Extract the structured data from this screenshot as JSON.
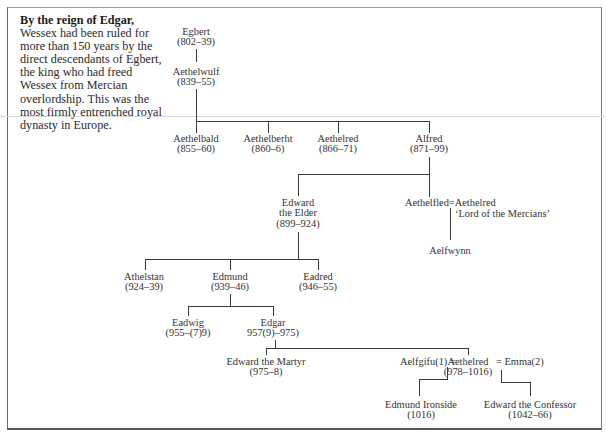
{
  "intro": {
    "lead": "By the reign of Edgar,",
    "body": "Wessex had been ruled for more than 150 years by the direct descendants of Egbert, the king who had freed Wessex from Mercian overlordship. This was the most firmly entrenched royal dynasty in Europe."
  },
  "tree": {
    "egbert": {
      "name": "Egbert",
      "dates": "(802–39)"
    },
    "aethelwulf": {
      "name": "Aethelwulf",
      "dates": "(839–55)"
    },
    "aethelbald": {
      "name": "Aethelbald",
      "dates": "(855–60)"
    },
    "aethelberht": {
      "name": "Aethelberht",
      "dates": "(860–6)"
    },
    "aethelred1": {
      "name": "Aethelred",
      "dates": "(866–71)"
    },
    "alfred": {
      "name": "Alfred",
      "dates": "(871–99)"
    },
    "edward_elder": {
      "name1": "Edward",
      "name2": "the Elder",
      "dates": "(899–924)"
    },
    "aethelfled": {
      "name": "Aethelfled",
      "marriage": "=",
      "spouse": "Aethelred",
      "spouse_title": "‘Lord of the Mercians’"
    },
    "aelfwynn": {
      "name": "Aelfwynn"
    },
    "athelstan": {
      "name": "Athelstan",
      "dates": "(924–39)"
    },
    "edmund": {
      "name": "Edmund",
      "dates": "(939–46)"
    },
    "eadred": {
      "name": "Eadred",
      "dates": "(946–55)"
    },
    "eadwig": {
      "name": "Eadwig",
      "dates": "(955–(7)9)"
    },
    "edgar": {
      "name": "Edgar",
      "dates": "957(9)–975)"
    },
    "edward_martyr": {
      "name": "Edward the Martyr",
      "dates": "(975–8)"
    },
    "aethelred2": {
      "wife1": "Aelfgifu(1) =",
      "name": "Aethelred",
      "wife2": "= Emma(2)",
      "dates": "(978–1016)"
    },
    "edmund_ironside": {
      "name": "Edmund Ironside",
      "dates": "(1016)"
    },
    "edward_confessor": {
      "name": "Edward the Confessor",
      "dates": "(1042–66)"
    }
  }
}
